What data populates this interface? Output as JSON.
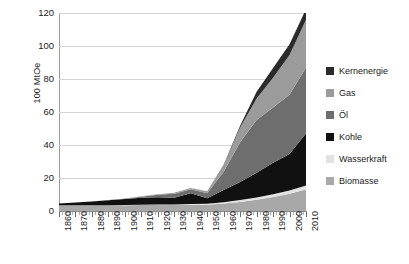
{
  "chart_data": {
    "type": "area",
    "title": "",
    "xlabel": "",
    "ylabel": "100 MtOe",
    "stacked": true,
    "grid": true,
    "legend_position": "right",
    "xlim": [
      1860,
      2010
    ],
    "ylim": [
      0,
      120
    ],
    "yticks": [
      0,
      20,
      40,
      60,
      80,
      100,
      120
    ],
    "categories": [
      1860,
      1870,
      1880,
      1890,
      1900,
      1910,
      1920,
      1930,
      1940,
      1950,
      1960,
      1970,
      1980,
      1990,
      2000,
      2010
    ],
    "xtick_labels": [
      "1860",
      "1870",
      "1880",
      "1890",
      "1900",
      "1910",
      "1920",
      "1930",
      "1940",
      "1950",
      "1960",
      "1970",
      "1980",
      "1990",
      "2000",
      "2010"
    ],
    "series": [
      {
        "name": "Biomasse",
        "color": "#a8a8a8",
        "values": [
          3.5,
          3.5,
          3.5,
          3.5,
          3.5,
          3.6,
          3.6,
          3.6,
          3.7,
          3.8,
          4.5,
          5.5,
          6.8,
          8.5,
          10.5,
          13.0
        ]
      },
      {
        "name": "Wasserkraft",
        "color": "#e2e2e2",
        "values": [
          0.0,
          0.0,
          0.0,
          0.0,
          0.1,
          0.2,
          0.3,
          0.4,
          0.5,
          0.6,
          0.8,
          1.1,
          1.4,
          1.7,
          2.0,
          2.4
        ]
      },
      {
        "name": "Kohle",
        "color": "#111111",
        "values": [
          1.0,
          1.6,
          2.2,
          3.0,
          3.6,
          4.2,
          4.4,
          4.0,
          6.5,
          3.3,
          7.5,
          11.0,
          15.0,
          19.0,
          22.0,
          31.5
        ]
      },
      {
        "name": "Öl",
        "color": "#6e6e6e",
        "values": [
          0.0,
          0.0,
          0.1,
          0.2,
          0.3,
          0.7,
          1.5,
          2.5,
          2.5,
          3.0,
          11.0,
          24.0,
          32.0,
          33.5,
          36.0,
          40.0
        ]
      },
      {
        "name": "Gas",
        "color": "#9b9b9b",
        "values": [
          0.0,
          0.0,
          0.0,
          0.0,
          0.1,
          0.2,
          0.4,
          0.6,
          0.8,
          1.2,
          4.0,
          9.0,
          13.0,
          18.0,
          24.0,
          29.0
        ]
      },
      {
        "name": "Kernenergie",
        "color": "#2b2b2b",
        "values": [
          0.0,
          0.0,
          0.0,
          0.0,
          0.0,
          0.0,
          0.0,
          0.0,
          0.0,
          0.0,
          0.2,
          1.0,
          4.0,
          6.0,
          6.5,
          6.5
        ]
      }
    ],
    "series_order_bottom_to_top": [
      "Biomasse",
      "Wasserkraft",
      "Kohle",
      "Öl",
      "Gas",
      "Kernenergie"
    ]
  },
  "legend": {
    "items": [
      {
        "label": "Kernenergie",
        "color": "#2b2b2b"
      },
      {
        "label": "Gas",
        "color": "#9b9b9b"
      },
      {
        "label": "Öl",
        "color": "#6e6e6e"
      },
      {
        "label": "Kohle",
        "color": "#111111"
      },
      {
        "label": "Wasserkraft",
        "color": "#e2e2e2"
      },
      {
        "label": "Biomasse",
        "color": "#a8a8a8"
      }
    ]
  },
  "axes": {
    "y_title": "100 MtOe",
    "y_tick_labels": [
      "120",
      "100",
      "80",
      "60",
      "40",
      "20",
      "0"
    ]
  }
}
